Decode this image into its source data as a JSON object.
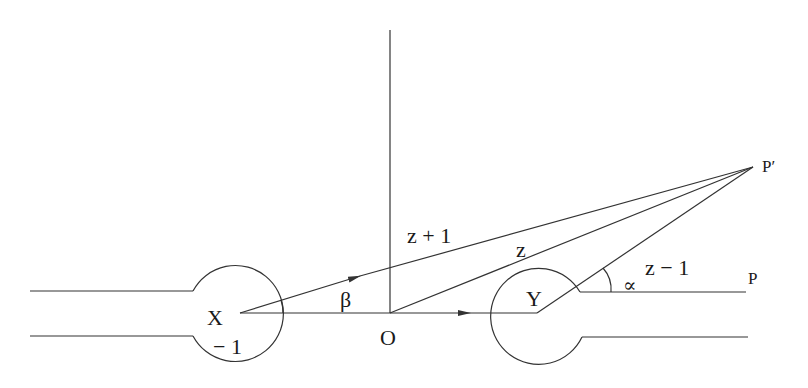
{
  "diagram": {
    "labels": {
      "X": "X",
      "minus_one": "− 1",
      "O": "O",
      "Y": "Y",
      "P": "P",
      "P_prime": "P′",
      "beta": "β",
      "alpha": "∝",
      "z_plus_1": "z + 1",
      "z": "z",
      "z_minus_1": "z − 1"
    },
    "colors": {
      "stroke": "#333333",
      "text": "#1a1a1a",
      "background": "#ffffff"
    }
  }
}
